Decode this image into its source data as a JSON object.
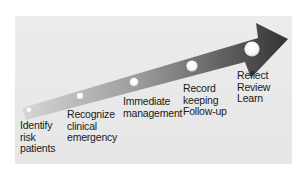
{
  "diagram": {
    "type": "progression-arrow",
    "colors": {
      "background": "#e8e8e8",
      "arrow_start": "#cfcfcf",
      "arrow_end": "#3a3a3a",
      "node": "#ffffff",
      "text": "#1a1a1a"
    },
    "steps": [
      {
        "lines": [
          "Identify",
          "risk",
          "patients"
        ]
      },
      {
        "lines": [
          "Recognize",
          "clinical",
          "emergency"
        ]
      },
      {
        "lines": [
          "Immediate",
          "management"
        ]
      },
      {
        "lines": [
          "Record",
          "keeping",
          "Follow-up"
        ]
      },
      {
        "lines": [
          "Reflect",
          "Review",
          "Learn"
        ]
      }
    ]
  }
}
